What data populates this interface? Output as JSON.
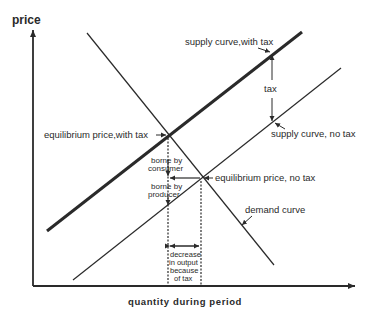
{
  "axes": {
    "y_label": "price",
    "x_label": "quantity during period"
  },
  "curves": {
    "supply_with_tax": "supply curve,with tax",
    "supply_no_tax": "supply curve, no tax",
    "demand": "demand curve"
  },
  "annotations": {
    "tax": "tax",
    "equilibrium_with_tax": "equilibrium price,with tax",
    "equilibrium_no_tax": "equilibrium price, no tax",
    "borne_by_consumer_1": "borne by",
    "borne_by_consumer_2": "consumer",
    "borne_by_producer_1": "borne by",
    "borne_by_producer_2": "producer",
    "decrease_1": "decrease",
    "decrease_2": "in output",
    "decrease_3": "because",
    "decrease_4": "of tax"
  },
  "colors": {
    "line": "#2a2a2a",
    "background": "#ffffff"
  }
}
